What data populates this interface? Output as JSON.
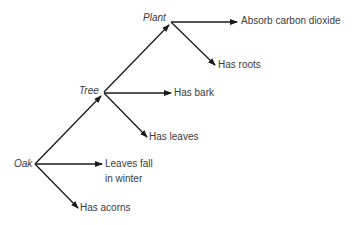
{
  "diagram": {
    "type": "hierarchy-concept-map",
    "colors": {
      "line": "#1a1a1a",
      "text": "#3a3a3a",
      "background": "#ffffff"
    },
    "nodes": {
      "plant": "Plant",
      "tree": "Tree",
      "oak": "Oak"
    },
    "properties": {
      "plant_1": "Absorb carbon dioxide",
      "plant_2": "Has roots",
      "tree_1": "Has bark",
      "tree_2": "Has leaves",
      "oak_1_line1": "Leaves fall",
      "oak_1_line2": "in winter",
      "oak_2": "Has acorns"
    },
    "edges": [
      {
        "from": "Oak",
        "to": "Tree",
        "type": "is-a"
      },
      {
        "from": "Tree",
        "to": "Plant",
        "type": "is-a"
      },
      {
        "from": "Plant",
        "to": "Absorb carbon dioxide"
      },
      {
        "from": "Plant",
        "to": "Has roots"
      },
      {
        "from": "Tree",
        "to": "Has bark"
      },
      {
        "from": "Tree",
        "to": "Has leaves"
      },
      {
        "from": "Oak",
        "to": "Leaves fall in winter"
      },
      {
        "from": "Oak",
        "to": "Has acorns"
      }
    ]
  }
}
